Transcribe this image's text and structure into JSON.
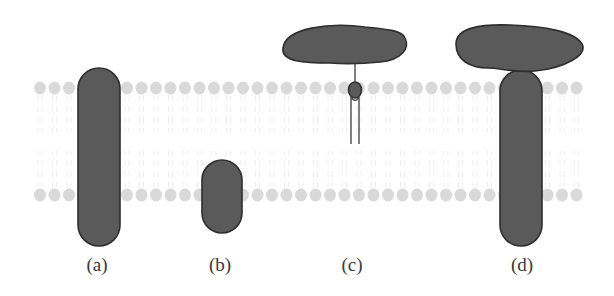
{
  "figure": {
    "colors": {
      "protein_fill": "#5a5a5a",
      "protein_stroke": "#2e2e2e",
      "lipid_head": "#d9d9d9",
      "lipid_tail": "#ececec",
      "background": "#ffffff",
      "label_text": "#3a3a3a"
    },
    "membrane": {
      "x_start": 40,
      "x_end": 585,
      "top_row_y": 88,
      "bottom_row_y": 195,
      "head_radius": 6,
      "head_spacing": 14.5
    },
    "panels": [
      {
        "id": "a",
        "label": "(a)",
        "label_x": 97,
        "type": "transmembrane-protein"
      },
      {
        "id": "b",
        "label": "(b)",
        "label_x": 220,
        "type": "monotopic-embedded-protein"
      },
      {
        "id": "c",
        "label": "(c)",
        "label_x": 352,
        "type": "lipid-anchored-protein"
      },
      {
        "id": "d",
        "label": "(d)",
        "label_x": 522,
        "type": "peripheral-protein-bound-to-integral-protein"
      }
    ]
  }
}
